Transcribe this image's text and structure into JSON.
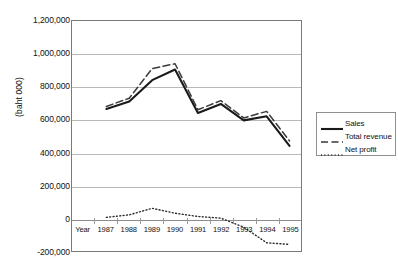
{
  "chart_data": {
    "type": "line",
    "title": "",
    "xlabel": "Year",
    "ylabel": "(baht 000)",
    "x_axis_name": "Year",
    "categories": [
      "1987",
      "1988",
      "1989",
      "1990",
      "1991",
      "1992",
      "1993",
      "1994",
      "1995"
    ],
    "ylim": [
      -200000,
      1200000
    ],
    "ytick_labels": [
      "1,200,000",
      "1,000,000",
      "800,000",
      "600,000",
      "400,000",
      "200,000",
      "0",
      "-200,000"
    ],
    "ytick_values": [
      1200000,
      1000000,
      800000,
      600000,
      400000,
      200000,
      0,
      -200000
    ],
    "grid": true,
    "legend_position": "right",
    "series": [
      {
        "name": "Sales",
        "style": "solid",
        "color": "#1a1a1a",
        "values": [
          665000,
          710000,
          840000,
          905000,
          640000,
          695000,
          595000,
          620000,
          440000
        ]
      },
      {
        "name": "Total revenue",
        "style": "dashed",
        "color": "#3a3a3a",
        "values": [
          680000,
          730000,
          910000,
          940000,
          660000,
          715000,
          610000,
          650000,
          470000
        ]
      },
      {
        "name": "Net profit",
        "style": "dotted",
        "color": "#2a2a2a",
        "values": [
          5000,
          20000,
          60000,
          30000,
          10000,
          0,
          -55000,
          -150000,
          -160000
        ]
      }
    ]
  }
}
